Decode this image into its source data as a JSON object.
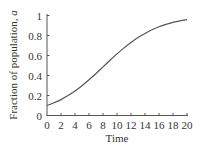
{
  "chart_data": {
    "type": "line",
    "title": "",
    "xlabel": "Time",
    "ylabel": "Fraction of population, ",
    "ylabel_var": "a",
    "xlim": [
      0,
      20
    ],
    "ylim": [
      0,
      1
    ],
    "grid": false,
    "legend": null,
    "x_ticks": [
      0,
      2,
      4,
      6,
      8,
      10,
      12,
      14,
      16,
      18,
      20
    ],
    "x_tick_labels": [
      "0",
      "2",
      "4",
      "6",
      "8",
      "10",
      "12",
      "14",
      "16",
      "18",
      "20"
    ],
    "y_ticks": [
      0,
      0.2,
      0.4,
      0.6,
      0.8,
      1
    ],
    "y_tick_labels": [
      "0",
      "0.2",
      "0.4",
      "0.6",
      "0.8",
      "1"
    ],
    "series": [
      {
        "name": "a",
        "description": "logistic growth curve",
        "color": "#555555",
        "x": [
          0,
          1,
          2,
          3,
          4,
          5,
          6,
          7,
          8,
          9,
          10,
          11,
          12,
          13,
          14,
          15,
          16,
          17,
          18,
          19,
          20
        ],
        "values": [
          0.1,
          0.127,
          0.159,
          0.199,
          0.245,
          0.298,
          0.357,
          0.42,
          0.486,
          0.552,
          0.616,
          0.676,
          0.731,
          0.779,
          0.821,
          0.857,
          0.887,
          0.911,
          0.931,
          0.947,
          0.959
        ]
      }
    ]
  },
  "colors": {
    "axis": "#555555",
    "text": "#333333",
    "curve": "#555555",
    "background": "#ffffff"
  }
}
